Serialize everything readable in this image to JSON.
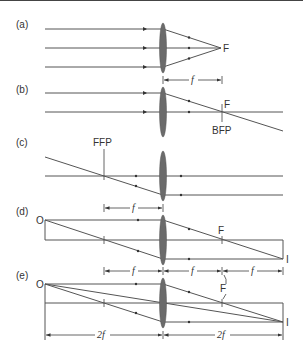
{
  "colors": {
    "line": "#555555",
    "lens": "#6b6b6b",
    "text": "#333333"
  },
  "panels": [
    {
      "id": "a",
      "label": "(a)",
      "focus_label": "F",
      "dim_label": "f"
    },
    {
      "id": "b",
      "label": "(b)",
      "focus_label": "F",
      "plane_label": "BFP"
    },
    {
      "id": "c",
      "label": "(c)",
      "plane_label": "FFP",
      "dim_label": "f"
    },
    {
      "id": "d",
      "label": "(d)",
      "object_label": "O",
      "focus_label": "F",
      "image_label": "I",
      "dim_labels": [
        "f",
        "f",
        "f"
      ]
    },
    {
      "id": "e",
      "label": "(e)",
      "object_label": "O",
      "focus_label": "F",
      "image_label": "I",
      "dim_labels": [
        "2f",
        "2f"
      ]
    }
  ]
}
